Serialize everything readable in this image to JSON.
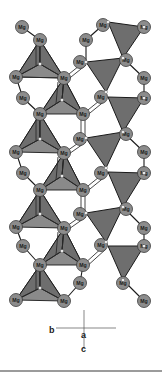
{
  "figure": {
    "type": "crystal-structure",
    "atom_label": "Mg",
    "colors": {
      "atom_fill": "#8c8c8c",
      "polyhedron_fill": "#6e6e6e",
      "bond": "#1a1a1a",
      "vertex": "#f2f2f2",
      "separator": "#7a7a7a"
    },
    "atoms": [
      {
        "id": "a1",
        "label": "Mg",
        "x": 22,
        "y": 27
      },
      {
        "id": "a2",
        "label": "Mg",
        "x": 40,
        "y": 40
      },
      {
        "id": "a3",
        "label": "Mg",
        "x": 16,
        "y": 77
      },
      {
        "id": "a4",
        "label": "Mg",
        "x": 64,
        "y": 78
      },
      {
        "id": "a5",
        "label": "Mg",
        "x": 23,
        "y": 98
      },
      {
        "id": "a6",
        "label": "Mg",
        "x": 40,
        "y": 114
      },
      {
        "id": "a7",
        "label": "Mg",
        "x": 83,
        "y": 114
      },
      {
        "id": "a8",
        "label": "Mg",
        "x": 86,
        "y": 40
      },
      {
        "id": "a9",
        "label": "Mg",
        "x": 80,
        "y": 62
      },
      {
        "id": "a10",
        "label": "Mg",
        "x": 103,
        "y": 25
      },
      {
        "id": "a11",
        "label": "Mg",
        "x": 144,
        "y": 27
      },
      {
        "id": "a12",
        "label": "Mg",
        "x": 126,
        "y": 60
      },
      {
        "id": "a13",
        "label": "Mg",
        "x": 144,
        "y": 78
      },
      {
        "id": "a14",
        "label": "Mg",
        "x": 144,
        "y": 98
      },
      {
        "id": "a15",
        "label": "Mg",
        "x": 101,
        "y": 97
      },
      {
        "id": "a16",
        "label": "Mg",
        "x": 16,
        "y": 152
      },
      {
        "id": "a17",
        "label": "Mg",
        "x": 64,
        "y": 153
      },
      {
        "id": "a18",
        "label": "Mg",
        "x": 23,
        "y": 173
      },
      {
        "id": "a19",
        "label": "Mg",
        "x": 40,
        "y": 190
      },
      {
        "id": "a20",
        "label": "Mg",
        "x": 83,
        "y": 190
      },
      {
        "id": "a21",
        "label": "Mg",
        "x": 80,
        "y": 139
      },
      {
        "id": "a22",
        "label": "Mg",
        "x": 126,
        "y": 134
      },
      {
        "id": "a23",
        "label": "Mg",
        "x": 144,
        "y": 152
      },
      {
        "id": "a24",
        "label": "Mg",
        "x": 144,
        "y": 173
      },
      {
        "id": "a25",
        "label": "Mg",
        "x": 101,
        "y": 173
      },
      {
        "id": "a26",
        "label": "Mg",
        "x": 80,
        "y": 214
      },
      {
        "id": "a27",
        "label": "Mg",
        "x": 16,
        "y": 227
      },
      {
        "id": "a28",
        "label": "Mg",
        "x": 64,
        "y": 228
      },
      {
        "id": "a29",
        "label": "Mg",
        "x": 23,
        "y": 246
      },
      {
        "id": "a30",
        "label": "Mg",
        "x": 40,
        "y": 265
      },
      {
        "id": "a31",
        "label": "Mg",
        "x": 83,
        "y": 265
      },
      {
        "id": "a32",
        "label": "Mg",
        "x": 126,
        "y": 209
      },
      {
        "id": "a33",
        "label": "Mg",
        "x": 144,
        "y": 228
      },
      {
        "id": "a34",
        "label": "Mg",
        "x": 144,
        "y": 246
      },
      {
        "id": "a35",
        "label": "Mg",
        "x": 101,
        "y": 245
      },
      {
        "id": "a36",
        "label": "Mg",
        "x": 80,
        "y": 283
      },
      {
        "id": "a37",
        "label": "Mg",
        "x": 16,
        "y": 300
      },
      {
        "id": "a38",
        "label": "Mg",
        "x": 64,
        "y": 301
      },
      {
        "id": "a39",
        "label": "Mg",
        "x": 126,
        "y": 283
      },
      {
        "id": "a40",
        "label": "Mg",
        "x": 144,
        "y": 301
      }
    ],
    "axes": {
      "horizontal_label": "b",
      "center_label": "a",
      "vertical_label": "c"
    }
  }
}
